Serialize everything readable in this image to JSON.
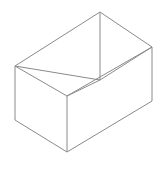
{
  "figure": {
    "type": "line-drawing",
    "background_color": "#ffffff",
    "stroke_color": "#8a8a8a",
    "stroke_width": 1,
    "canvas": {
      "width": 164,
      "height": 173
    },
    "vertices": {
      "top_back": {
        "x": 100,
        "y": 12
      },
      "top_left": {
        "x": 15,
        "y": 66
      },
      "top_right": {
        "x": 152,
        "y": 47
      },
      "top_front": {
        "x": 67,
        "y": 96
      },
      "mid_center": {
        "x": 100,
        "y": 80
      },
      "bottom_left": {
        "x": 15,
        "y": 120
      },
      "bottom_right": {
        "x": 152,
        "y": 101
      },
      "bottom_front": {
        "x": 67,
        "y": 152
      }
    },
    "edges": [
      {
        "name": "top-back-to-top-left",
        "d": "M 100 12 L 15 66"
      },
      {
        "name": "top-back-to-top-right",
        "d": "M 100 12 L 152 47"
      },
      {
        "name": "top-left-to-top-front",
        "d": "M 15 66 L 67 96"
      },
      {
        "name": "top-right-to-top-front",
        "d": "M 152 47 L 67 96"
      },
      {
        "name": "vertical-back-center",
        "d": "M 100 12 L 100 80"
      },
      {
        "name": "inner-center-to-top-left",
        "d": "M 100 80 L 15 66"
      },
      {
        "name": "inner-center-to-top-right",
        "d": "M 100 80 L 152 47"
      },
      {
        "name": "inner-center-to-top-front",
        "d": "M 100 80 L 67 96"
      },
      {
        "name": "vertical-left-side",
        "d": "M 15 66 L 15 120"
      },
      {
        "name": "vertical-right-side",
        "d": "M 152 47 L 152 101"
      },
      {
        "name": "vertical-front-edge",
        "d": "M 67 96 L 67 152"
      },
      {
        "name": "bottom-left-to-bottom-front",
        "d": "M 15 120 L 67 152"
      },
      {
        "name": "bottom-right-to-bottom-front",
        "d": "M 152 101 L 67 152"
      }
    ]
  }
}
